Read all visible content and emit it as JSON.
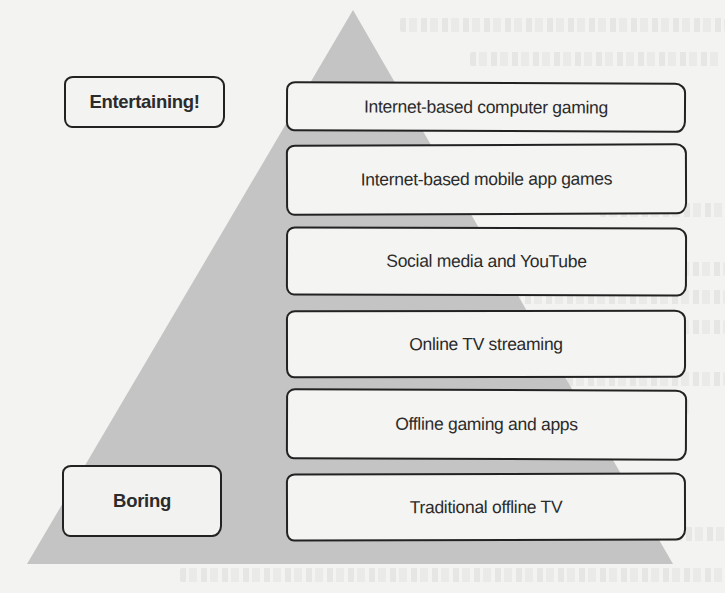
{
  "diagram": {
    "type": "pyramid",
    "colors": {
      "pyramid_fill": "#c4c4c4",
      "box_fill": "#f4f4f2",
      "box_border": "#222222",
      "text": "#2b2b2b",
      "page": "#f3f3f1"
    },
    "scale_labels": {
      "top": "Entertaining!",
      "bottom": "Boring"
    },
    "tiers": [
      {
        "rank": 1,
        "label": "Internet-based computer gaming"
      },
      {
        "rank": 2,
        "label": "Internet-based mobile app games"
      },
      {
        "rank": 3,
        "label": "Social media and YouTube"
      },
      {
        "rank": 4,
        "label": "Online TV streaming"
      },
      {
        "rank": 5,
        "label": "Offline gaming and apps"
      },
      {
        "rank": 6,
        "label": "Traditional offline TV"
      }
    ]
  }
}
